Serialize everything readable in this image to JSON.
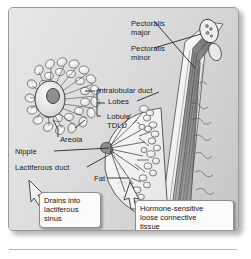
{
  "figure": {
    "panel_background": "#dcdcdc",
    "border_color": "#9a9a9a",
    "ink_color": "#1b1b1b"
  },
  "labels": {
    "pectoralis_major": "Pectoralis\nmajor",
    "pectoralis_minor": "Pectoralis\nminor",
    "intralobular_duct": "Intralobular duct",
    "lobes": "Lobes",
    "lobule_tdlu": "Lobule\nTDLU",
    "areola": "Areola",
    "nipple": "Nipple",
    "lactiferous_duct": "Lactiferous duct",
    "fat": "Fat"
  },
  "callouts": {
    "lactiferous_sinus": "Drains into\nlactiferous\nsinus",
    "connective_tissue": "Hormone-sensitive\nloose connective\ntissue"
  }
}
